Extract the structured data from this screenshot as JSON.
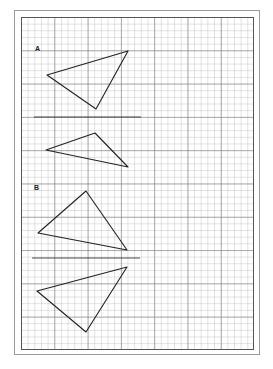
{
  "figure": {
    "sections": [
      {
        "label": "A",
        "label_pos": [
          35,
          45
        ],
        "divider": {
          "x1": 34,
          "x2": 141,
          "y": 117
        },
        "triangle_original": [
          [
            47,
            75
          ],
          [
            128,
            51
          ],
          [
            96,
            109
          ]
        ],
        "triangle_reflection": [
          [
            46,
            150
          ],
          [
            95,
            133
          ],
          [
            128,
            167
          ]
        ]
      },
      {
        "label": "B",
        "label_pos": [
          34,
          184
        ],
        "divider": {
          "x1": 32,
          "x2": 140,
          "y": 258
        },
        "triangle_original": [
          [
            38,
            233
          ],
          [
            86,
            191
          ],
          [
            127,
            250
          ]
        ],
        "triangle_reflection": [
          [
            37,
            291
          ],
          [
            127,
            267
          ],
          [
            86,
            332
          ]
        ]
      }
    ],
    "grid": {
      "minor_spacing_px": 6.66,
      "major_every": 5
    },
    "colors": {
      "line": "#222222",
      "grid_minor": "#c8c8c8",
      "grid_major": "#8a8a8a"
    }
  }
}
